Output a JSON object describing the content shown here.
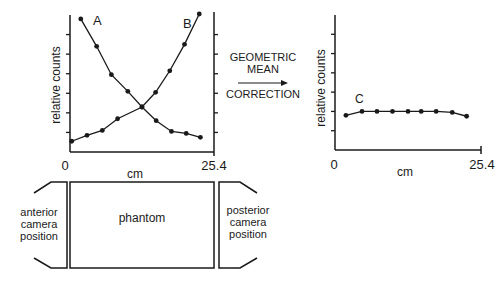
{
  "chart_data": [
    {
      "type": "line",
      "title": "",
      "xlabel": "cm",
      "ylabel": "relative counts",
      "xlim": [
        0,
        25.4
      ],
      "x_tick_labels": [
        "0",
        "25.4"
      ],
      "ylim": [
        0,
        7
      ],
      "y_ticks_count": 6,
      "grid": false,
      "series": [
        {
          "name": "A",
          "x": [
            1.9,
            4.7,
            7.3,
            10.2,
            12.7,
            15.2,
            17.9,
            20.5,
            23.0
          ],
          "values": [
            6.8,
            5.4,
            3.95,
            3.1,
            2.3,
            1.6,
            1.05,
            0.95,
            0.75
          ]
        },
        {
          "name": "B",
          "x": [
            0.3,
            3.0,
            5.7,
            8.4,
            12.7,
            15.1,
            17.6,
            20.2,
            22.8
          ],
          "values": [
            0.55,
            0.85,
            1.1,
            1.7,
            2.3,
            3.05,
            4.15,
            5.5,
            7.05
          ]
        }
      ]
    },
    {
      "type": "line",
      "title": "",
      "xlabel": "cm",
      "ylabel": "relative counts",
      "xlim": [
        0,
        25.4
      ],
      "x_tick_labels": [
        "0",
        "25.4"
      ],
      "ylim": [
        0,
        7
      ],
      "y_ticks_count": 6,
      "grid": false,
      "series": [
        {
          "name": "C",
          "x": [
            1.9,
            4.7,
            7.3,
            10.0,
            12.7,
            15.0,
            17.6,
            20.4,
            22.9
          ],
          "values": [
            1.8,
            2.0,
            2.0,
            2.0,
            2.0,
            2.0,
            2.0,
            1.95,
            1.75
          ]
        }
      ]
    }
  ],
  "middle": {
    "line1": "GEOMETRIC",
    "line2": "MEAN",
    "line3": "CORRECTION"
  },
  "phantom": {
    "center_label": "phantom",
    "left_label": [
      "anterior",
      "camera",
      "position"
    ],
    "right_label": [
      "posterior",
      "camera",
      "position"
    ]
  }
}
